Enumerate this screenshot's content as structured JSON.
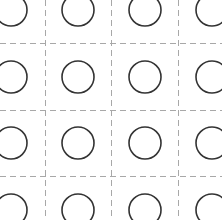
{
  "canvas": {
    "width": 222,
    "height": 220,
    "background": "#ffffff"
  },
  "grid": {
    "color": "#a8a8a8",
    "stroke_width": 1,
    "dash": "6 4",
    "vertical_x": [
      45,
      111,
      178
    ],
    "horizontal_y": [
      43,
      110,
      176
    ]
  },
  "circles": {
    "color": "#333333",
    "stroke_width": 1.6,
    "radius": 16,
    "centers_x": [
      11,
      78,
      145,
      212
    ],
    "centers_y": [
      10,
      77,
      143,
      210
    ]
  }
}
